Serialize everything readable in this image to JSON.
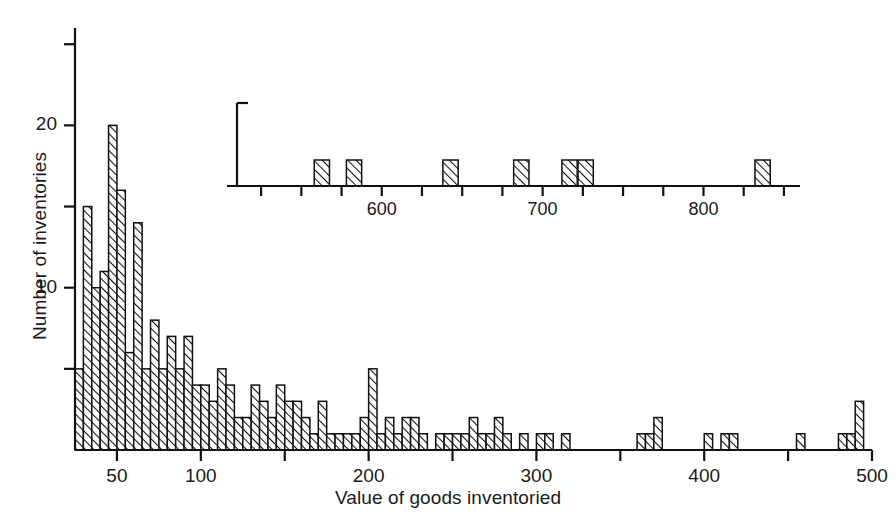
{
  "chart_data": {
    "type": "bar",
    "title": "",
    "subtitle": "",
    "xlabel": "Value of goods inventoried",
    "ylabel": "Number of inventories",
    "grid": false,
    "legend": null,
    "bin_width": 5,
    "xlim": [
      25,
      500
    ],
    "ylim": [
      0,
      26
    ],
    "xticks_major": [
      50,
      100,
      200,
      300,
      400,
      500
    ],
    "xticks_minor": [
      150,
      250,
      350,
      450
    ],
    "xtick_labels": [
      "50",
      "100",
      "200",
      "300",
      "400",
      "500"
    ],
    "yticks_major": [
      10,
      20
    ],
    "yticks_minor": [
      5,
      15,
      25
    ],
    "ytick_labels": [
      "10",
      "20"
    ],
    "categories": [
      25,
      30,
      35,
      40,
      45,
      50,
      55,
      60,
      65,
      70,
      75,
      80,
      85,
      90,
      95,
      100,
      105,
      110,
      115,
      120,
      125,
      130,
      135,
      140,
      145,
      150,
      155,
      160,
      165,
      170,
      175,
      180,
      185,
      190,
      195,
      200,
      205,
      210,
      215,
      220,
      225,
      230,
      235,
      240,
      245,
      250,
      255,
      260,
      265,
      270,
      275,
      280,
      285,
      290,
      295,
      300,
      305,
      310,
      315,
      320,
      325,
      330,
      335,
      340,
      345,
      350,
      355,
      360,
      365,
      370,
      375,
      380,
      385,
      390,
      395,
      400,
      405,
      410,
      415,
      420,
      425,
      430,
      435,
      440,
      445,
      450,
      455,
      460,
      465,
      470,
      475,
      480,
      485,
      490,
      495
    ],
    "values": [
      5,
      15,
      10,
      11,
      20,
      16,
      6,
      14,
      5,
      8,
      5,
      7,
      5,
      7,
      4,
      4,
      3,
      5,
      4,
      2,
      2,
      4,
      3,
      2,
      4,
      3,
      3,
      2,
      1,
      3,
      1,
      1,
      1,
      1,
      2,
      5,
      1,
      2,
      1,
      2,
      2,
      1,
      0,
      1,
      1,
      1,
      1,
      2,
      1,
      1,
      2,
      1,
      0,
      1,
      0,
      1,
      1,
      0,
      1,
      0,
      0,
      0,
      0,
      0,
      0,
      0,
      0,
      1,
      1,
      2,
      0,
      0,
      0,
      0,
      0,
      1,
      0,
      1,
      1,
      0,
      0,
      0,
      0,
      0,
      0,
      0,
      1,
      0,
      0,
      0,
      0,
      1,
      1,
      3,
      0
    ],
    "bar_style": {
      "fill": "diagonal-hatch",
      "edge_color": "#111111",
      "hatch_color": "#111111"
    },
    "inset": {
      "type": "bar",
      "xlim": [
        510,
        860
      ],
      "ylim": [
        0,
        14
      ],
      "xticks_major": [
        600,
        700,
        800
      ],
      "xticks_minor": [
        525,
        550,
        575,
        625,
        650,
        675,
        725,
        750,
        775,
        825,
        850
      ],
      "xtick_labels": [
        "600",
        "700",
        "800"
      ],
      "bin_width": 5,
      "categories": [
        558,
        578,
        638,
        682,
        712,
        722,
        832
      ],
      "values": [
        1,
        1,
        1,
        1,
        1,
        1,
        1
      ]
    }
  }
}
